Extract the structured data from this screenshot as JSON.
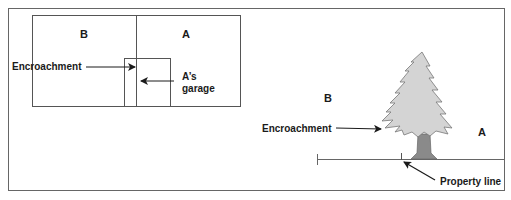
{
  "left_diagram": {
    "label_b": "B",
    "label_a": "A",
    "encroachment_label": "Encroachment",
    "garage_label_line1": "A’s",
    "garage_label_line2": "garage"
  },
  "right_diagram": {
    "label_b": "B",
    "label_a": "A",
    "encroachment_label": "Encroachment",
    "property_line_label": "Property line"
  },
  "colors": {
    "line": "#555555",
    "tree_fill": "#d4d4d4",
    "trunk_fill": "#8a8a8a",
    "text": "#1a1a1a"
  }
}
